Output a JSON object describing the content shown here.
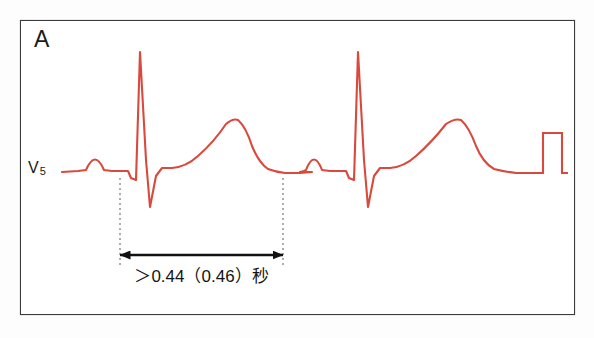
{
  "figure": {
    "panel_letter": "A",
    "lead_label_main": "V",
    "lead_label_subscript": "5",
    "interval_caption": "＞0.44（0.46）秒",
    "colors": {
      "trace": "#d9493c",
      "frame": "#3a3a3a",
      "text": "#1a1a1a",
      "annotation": "#111111",
      "background": "#ffffff",
      "page": "#fdfdfd"
    }
  },
  "chart_data": {
    "type": "line",
    "title": "A",
    "xlabel": "",
    "ylabel": "V5",
    "series": [
      {
        "name": "ecg-lead-v5",
        "color": "#d9493c",
        "baseline_y": 172,
        "path": "M 62,172 L 78,171 L 86,170 Q 95,149 104,170 L 112,171 L 128,171 L 131,178 L 136,180 L 140,52 L 146,160 L 150,207 L 156,176 L 162,168 L 172,168 Q 186,167 198,156 Q 214,142 226,124 Q 233,118 238,120 Q 246,127 252,146 Q 259,163 268,169 Q 276,172 285,173 L 300,173 L 312,172 L 300,172 L 304,171 L 306,170 Q 314,149 322,170 L 330,171 L 346,171 L 349,178 L 354,180 L 358,52 L 364,160 L 368,207 L 374,176 L 380,168 L 390,168 Q 404,167 416,156 Q 432,142 446,124 Q 455,118 461,120 Q 469,127 476,146 Q 483,163 494,169 Q 506,172 516,173 L 532,173"
      },
      {
        "name": "calibration-pulse",
        "color": "#d9493c",
        "path": "M 532,173 L 543,173 L 543,133 L 562,133 L 562,173 L 568,173"
      }
    ],
    "annotations": [
      {
        "name": "qt-interval-marker",
        "kind": "double-arrow",
        "x_start": 120,
        "x_end": 283,
        "y": 255,
        "label": "＞0.44（0.46）秒"
      },
      {
        "name": "qt-caliper-left",
        "kind": "dotted-vertical",
        "x": 120,
        "y_top": 178,
        "y_bottom": 265
      },
      {
        "name": "qt-caliper-right",
        "kind": "dotted-vertical",
        "x": 283,
        "y_top": 178,
        "y_bottom": 265
      }
    ],
    "grid": false,
    "legend": false
  }
}
